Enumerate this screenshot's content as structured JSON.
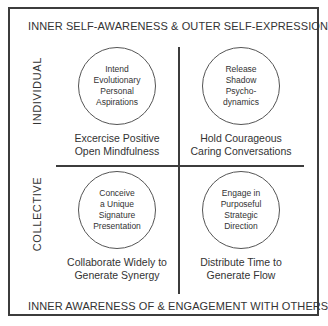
{
  "diagram": {
    "top_axis_label": "INNER SELF-AWARENESS & OUTER SELF-EXPRESSION",
    "bottom_axis_label": "INNER AWARENESS OF & ENGAGEMENT WITH OTHERS",
    "row_labels": [
      "INDIVIDUAL",
      "COLLECTIVE"
    ],
    "quadrants": [
      {
        "circle_text": "Intend\nEvolutionary\nPersonal\nAspirations",
        "caption": "Excercise Positive\nOpen Mindfulness"
      },
      {
        "circle_text": "Release\nShadow\nPsycho-\ndynamics",
        "caption": "Hold Courageous\nCaring Conversations"
      },
      {
        "circle_text": "Conceive\na Unique\nSignature\nPresentation",
        "caption": "Collaborate Widely to\nGenerate Synergy"
      },
      {
        "circle_text": "Engage in\nPurposeful\nStrategic\nDirection",
        "caption": "Distribute Time to\nGenerate Flow"
      }
    ]
  }
}
